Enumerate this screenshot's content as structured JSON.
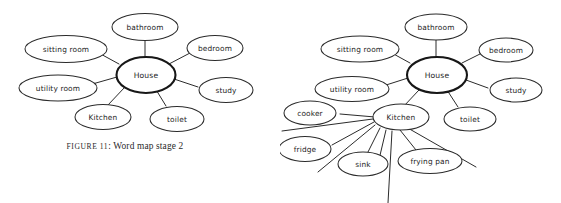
{
  "page": {
    "background_color": "#ffffff",
    "ink_color": "#2b2b2b"
  },
  "caption": {
    "prefix": "FIGURE 11",
    "separator": ": ",
    "text": "Word map stage 2",
    "full": "FIGURE 11: Word map stage 2"
  },
  "diagrams": [
    {
      "id": "word-map-stage-2",
      "center": {
        "label": "House"
      },
      "nodes": [
        {
          "label": "bathroom"
        },
        {
          "label": "bedroom"
        },
        {
          "label": "study"
        },
        {
          "label": "toilet"
        },
        {
          "label": "Kitchen"
        },
        {
          "label": "utility room"
        },
        {
          "label": "sitting room"
        }
      ]
    },
    {
      "id": "word-map-stage-3",
      "center": {
        "label": "House"
      },
      "nodes": [
        {
          "label": "bathroom"
        },
        {
          "label": "bedroom"
        },
        {
          "label": "study"
        },
        {
          "label": "toilet"
        },
        {
          "label": "Kitchen"
        },
        {
          "label": "utility room"
        },
        {
          "label": "sitting room"
        }
      ],
      "kitchen_center": {
        "label": "Kitchen"
      },
      "kitchen_nodes": [
        {
          "label": "cooker"
        },
        {
          "label": "fridge"
        },
        {
          "label": "sink"
        },
        {
          "label": "frying pan"
        }
      ],
      "kitchen_blank_branches": 5
    }
  ]
}
